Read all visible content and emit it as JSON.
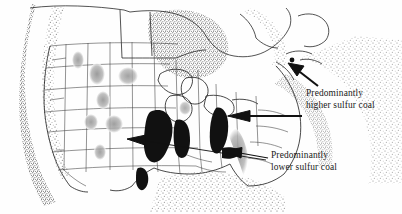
{
  "figure": {
    "type": "thematic-map",
    "region": "North America (contiguous United States and southern Canada)",
    "background_color": "#fefefe",
    "ink_color": "#1a1a1a"
  },
  "annotations": {
    "higher_sulfur": {
      "line1": "Predominantly",
      "line2": "higher sulfur coal",
      "full_text": "Predominantly higher sulfur coal",
      "marker_color": "#111111",
      "arrow_count": 2
    },
    "lower_sulfur": {
      "line1": "Predominantly",
      "line2": "lower sulfur coal",
      "full_text": "Predominantly lower sulfur coal",
      "marker_color": "#9a9a9a",
      "arrow_count": 2
    }
  },
  "legend_classes": [
    {
      "name": "higher-sulfur-coal",
      "fill": "#111111",
      "label": "Predominantly higher sulfur coal"
    },
    {
      "name": "lower-sulfur-coal",
      "fill": "#9a9a9a",
      "label": "Predominantly lower sulfur coal"
    }
  ],
  "map_features": {
    "ocean_texture": "stipple",
    "border_style": "thin-line",
    "higher_sulfur_deposits": [
      "Illinois Basin",
      "Indiana",
      "Northern Appalachian",
      "Western Kentucky",
      "Arkansas - Oklahoma"
    ],
    "lower_sulfur_deposits": [
      "Montana - Powder River",
      "Wyoming",
      "Utah",
      "Colorado",
      "New Mexico",
      "North Dakota",
      "Southern Appalachian",
      "Michigan"
    ]
  }
}
